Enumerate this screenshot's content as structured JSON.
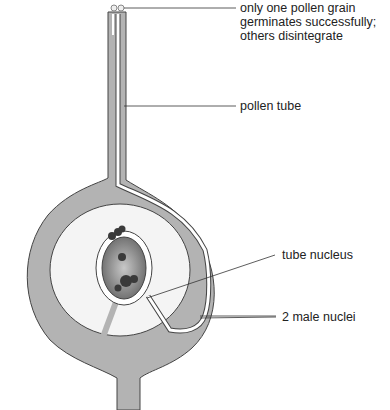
{
  "diagram": {
    "labels": {
      "pollen_grain": [
        "only one pollen grain",
        "germinates successfully;",
        "others disintegrate"
      ],
      "pollen_tube": "pollen tube",
      "tube_nucleus": "tube nucleus",
      "male_nuclei": "2 male nuclei"
    },
    "colors": {
      "tissue": "#b3b3b3",
      "outline": "#444444",
      "tube": "#ffffff",
      "embryo_sac": "#8a8a8a",
      "nuclei": "#3a3a3a",
      "leader": "#333333"
    }
  }
}
